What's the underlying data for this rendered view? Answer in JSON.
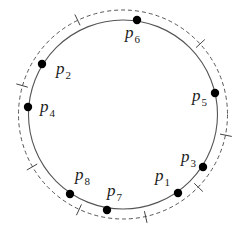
{
  "diagram": {
    "width": 243,
    "height": 232,
    "center": {
      "x": 123,
      "y": 114.5
    },
    "inner_circle": {
      "radius": 94.5,
      "style": "solid",
      "stroke": "#555555",
      "stroke_width": 1.1
    },
    "outer_circle": {
      "radius": 104.5,
      "style": "dashed",
      "stroke": "#555555",
      "stroke_width": 1.0,
      "dash": "4,3"
    },
    "tick_marks": {
      "angles_deg": [
        -115.7,
        -42.5,
        11.4,
        44,
        77.5,
        114.8,
        150,
        -164
      ],
      "inner_radius": 99,
      "outer_radius": 111,
      "stroke": "#444444"
    },
    "points": [
      {
        "id": "p1",
        "base": "p",
        "sub": "1",
        "x": 178,
        "y": 193,
        "label_x": 155,
        "label_y": 181
      },
      {
        "id": "p2",
        "base": "p",
        "sub": "2",
        "x": 42,
        "y": 64,
        "label_x": 56,
        "label_y": 74
      },
      {
        "id": "p3",
        "base": "p",
        "sub": "3",
        "x": 203,
        "y": 167,
        "label_x": 181,
        "label_y": 162
      },
      {
        "id": "p4",
        "base": "p",
        "sub": "4",
        "x": 28,
        "y": 107,
        "label_x": 40,
        "label_y": 112
      },
      {
        "id": "p5",
        "base": "p",
        "sub": "5",
        "x": 215,
        "y": 93,
        "label_x": 192,
        "label_y": 101
      },
      {
        "id": "p6",
        "base": "p",
        "sub": "6",
        "x": 137,
        "y": 20,
        "label_x": 125,
        "label_y": 38
      },
      {
        "id": "p7",
        "base": "p",
        "sub": "7",
        "x": 107,
        "y": 210,
        "label_x": 107,
        "label_y": 196
      },
      {
        "id": "p8",
        "base": "p",
        "sub": "8",
        "x": 70,
        "y": 194,
        "label_x": 75,
        "label_y": 180
      }
    ],
    "dot_radius": 4.2,
    "dot_color": "#000000"
  }
}
